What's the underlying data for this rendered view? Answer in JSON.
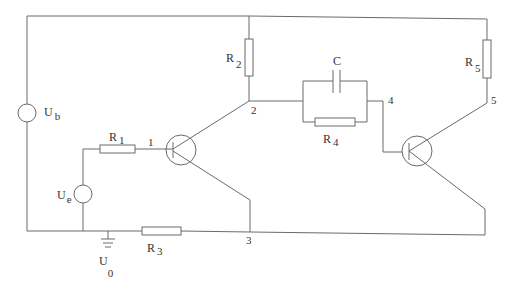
{
  "diagram": {
    "type": "circuit-schematic",
    "components": {
      "Ub": {
        "label": "U",
        "sub": "b",
        "kind": "voltage-source"
      },
      "Ue": {
        "label": "U",
        "sub": "e",
        "kind": "voltage-source"
      },
      "U0": {
        "label": "U",
        "sub": "0",
        "kind": "ground"
      },
      "R1": {
        "label": "R",
        "sub": "1",
        "kind": "resistor"
      },
      "R2": {
        "label": "R",
        "sub": "2",
        "kind": "resistor"
      },
      "R3": {
        "label": "R",
        "sub": "3",
        "kind": "resistor"
      },
      "R4": {
        "label": "R",
        "sub": "4",
        "kind": "resistor"
      },
      "R5": {
        "label": "R",
        "sub": "5",
        "kind": "resistor"
      },
      "C": {
        "label": "C",
        "kind": "capacitor"
      },
      "T1": {
        "kind": "transistor"
      },
      "T2": {
        "kind": "transistor"
      }
    },
    "nodes": {
      "n1": "1",
      "n2": "2",
      "n3": "3",
      "n4": "4",
      "n5": "5"
    }
  }
}
